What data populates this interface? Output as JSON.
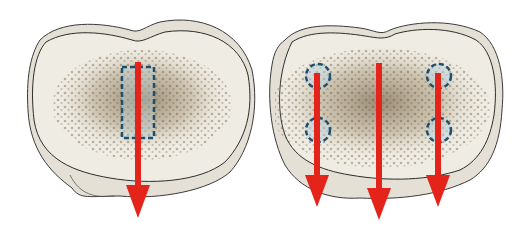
{
  "figure": {
    "colors": {
      "background": "#ffffff",
      "bone_fill": "#efece3",
      "bone_rim": "#d9d5c9",
      "outline": "#3a3a3a",
      "trabecular": "#8c7a5e",
      "arrow": "#e4231b",
      "marker": "#1d4f6e",
      "marker_fill": "#b9d3e0"
    },
    "panels": [
      {
        "id": "left",
        "arrows": [
          {
            "x": 138,
            "y_start": 62,
            "y_end": 218
          }
        ],
        "markers": [
          {
            "shape": "rect",
            "x": 122,
            "y": 67,
            "w": 32,
            "h": 71
          }
        ]
      },
      {
        "id": "right",
        "arrows": [
          {
            "x": 317,
            "y_start": 73,
            "y_end": 207
          },
          {
            "x": 379,
            "y_start": 63,
            "y_end": 220
          },
          {
            "x": 438,
            "y_start": 73,
            "y_end": 207
          }
        ],
        "markers": [
          {
            "shape": "circle",
            "cx": 318,
            "cy": 76,
            "r": 12
          },
          {
            "shape": "circle",
            "cx": 318,
            "cy": 130,
            "r": 12
          },
          {
            "shape": "circle",
            "cx": 439,
            "cy": 76,
            "r": 12
          },
          {
            "shape": "circle",
            "cx": 439,
            "cy": 130,
            "r": 12
          }
        ]
      }
    ]
  }
}
